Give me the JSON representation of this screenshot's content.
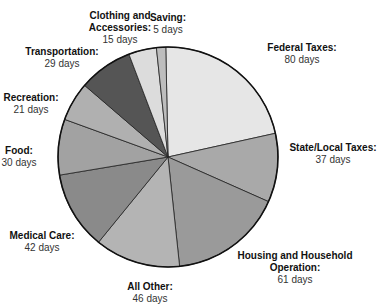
{
  "chart_data": {
    "type": "pie",
    "title": "",
    "unit": "days",
    "categories": [
      "Federal Taxes",
      "State/Local Taxes",
      "Housing and Household Operation",
      "All Other",
      "Medical Care",
      "Food",
      "Recreation",
      "Transportation",
      "Clothing and Accessories",
      "Saving"
    ],
    "values": [
      80,
      37,
      61,
      46,
      42,
      30,
      21,
      29,
      15,
      5
    ],
    "colors": [
      "#e6e6e6",
      "#a9a9a9",
      "#9a9a9a",
      "#b4b4b4",
      "#8a8a8a",
      "#a2a2a2",
      "#b0b0b0",
      "#555555",
      "#dcdcdc",
      "#bdbdbd"
    ],
    "legend": "direct labels"
  },
  "labels": [
    {
      "name": "Federal Taxes:",
      "value": "80 days"
    },
    {
      "name": "State/Local Taxes:",
      "value": "37 days"
    },
    {
      "name": "Housing and Household Operation:",
      "value": "61 days"
    },
    {
      "name": "All Other:",
      "value": "46 days"
    },
    {
      "name": "Medical Care:",
      "value": "42 days"
    },
    {
      "name": "Food:",
      "value": "30 days"
    },
    {
      "name": "Recreation:",
      "value": "21 days"
    },
    {
      "name": "Transportation:",
      "value": "29 days"
    },
    {
      "name": "Clothing and Accessories:",
      "value": "15 days"
    },
    {
      "name": "Saving:",
      "value": "5 days"
    }
  ]
}
